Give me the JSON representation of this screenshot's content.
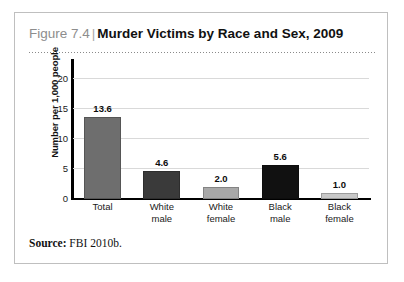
{
  "figure": {
    "number": "Figure 7.4",
    "separator": "|",
    "title": "Murder Victims by Race and Sex, 2009",
    "source_label": "Source:",
    "source_text": "FBI 2010b."
  },
  "chart_data": {
    "type": "bar",
    "title": "Murder Victims by Race and Sex, 2009",
    "xlabel": "",
    "ylabel": "Number per 1,000 people",
    "categories": [
      "Total",
      "White male",
      "White female",
      "Black male",
      "Black female"
    ],
    "category_lines": [
      [
        "Total",
        ""
      ],
      [
        "White",
        "male"
      ],
      [
        "White",
        "female"
      ],
      [
        "Black",
        "male"
      ],
      [
        "Black",
        "female"
      ]
    ],
    "values": [
      13.6,
      4.6,
      2.0,
      5.6,
      1.0
    ],
    "value_labels": [
      "13.6",
      "4.6",
      "2.0",
      "5.6",
      "1.0"
    ],
    "bar_colors": [
      "#6e6e6e",
      "#3a3a3a",
      "#a8a8a8",
      "#111111",
      "#c8c8c8"
    ],
    "ylim": [
      0,
      22
    ],
    "yticks": [
      0,
      5,
      10,
      15,
      20
    ],
    "ytick_labels": [
      "0",
      "5",
      "10",
      "15",
      "20"
    ],
    "grid": true,
    "legend": "none"
  }
}
